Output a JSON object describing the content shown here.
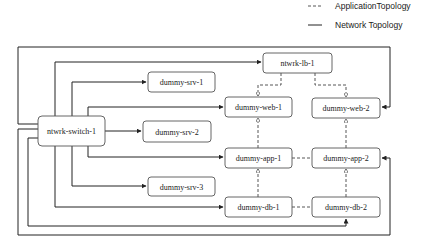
{
  "legend": {
    "application_label": "ApplicationTopology",
    "network_label": "Network Topology"
  },
  "nodes": {
    "switch": "ntwrk-switch-1",
    "lb": "ntwrk-lb-1",
    "srv1": "dummy-srv-1",
    "srv2": "dummy-srv-2",
    "srv3": "dummy-srv-3",
    "web1": "dummy-web-1",
    "web2": "dummy-web-2",
    "app1": "dummy-app-1",
    "app2": "dummy-app-2",
    "db1": "dummy-db-1",
    "db2": "dummy-db-2"
  },
  "colors": {
    "line": "#222222",
    "box_border": "#555555",
    "background": "#ffffff"
  }
}
